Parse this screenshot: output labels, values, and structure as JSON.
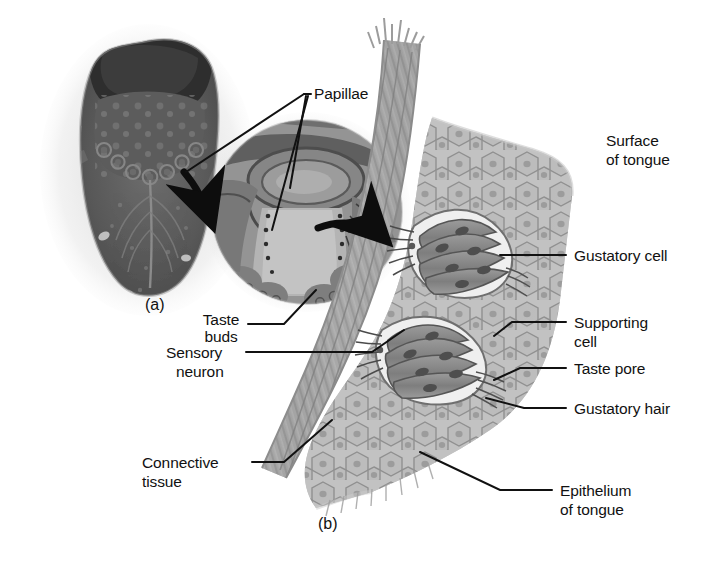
{
  "figure": {
    "panels": [
      {
        "id": "a",
        "label": "(a)",
        "caption": "Dorsal view of the tongue with papillae and histological section"
      },
      {
        "id": "b",
        "label": "(b)",
        "caption": "Detailed illustration of taste buds within the tongue epithelium"
      }
    ]
  },
  "labels": {
    "papillae": "Papillae",
    "taste_buds_line1": "Taste",
    "taste_buds_line2": "buds",
    "sensory_line1": "Sensory",
    "sensory_line2": "neuron",
    "surface_line1": "Surface",
    "surface_line2": "of tongue",
    "gustatory_cell": "Gustatory cell",
    "supporting_line1": "Supporting",
    "supporting_line2": "cell",
    "taste_pore": "Taste pore",
    "gustatory_hair": "Gustatory hair",
    "connective_line1": "Connective",
    "connective_line2": "tissue",
    "epithelium_line1": "Epithelium",
    "epithelium_line2": "of tongue",
    "panel_a": "(a)",
    "panel_b": "(b)"
  },
  "colors": {
    "background": "#ffffff",
    "leader_line": "#111111",
    "text": "#111111",
    "epithelium_cell": "#b9b9b9",
    "epithelium_outline": "#8a8a8a",
    "epithelium_nucleus": "#9a9a9a",
    "connective_band": "#a3a3a3",
    "connective_band_dark": "#8c8c8c",
    "taste_bud_cell": "#8e8e8e",
    "taste_bud_cell_light": "#f2f2f2",
    "tongue_photo_dark": "#4a4a4a",
    "tongue_photo_mid": "#6f6f6f",
    "section_photo": "#7d7d7d",
    "arrow": "#0d0d0d"
  }
}
